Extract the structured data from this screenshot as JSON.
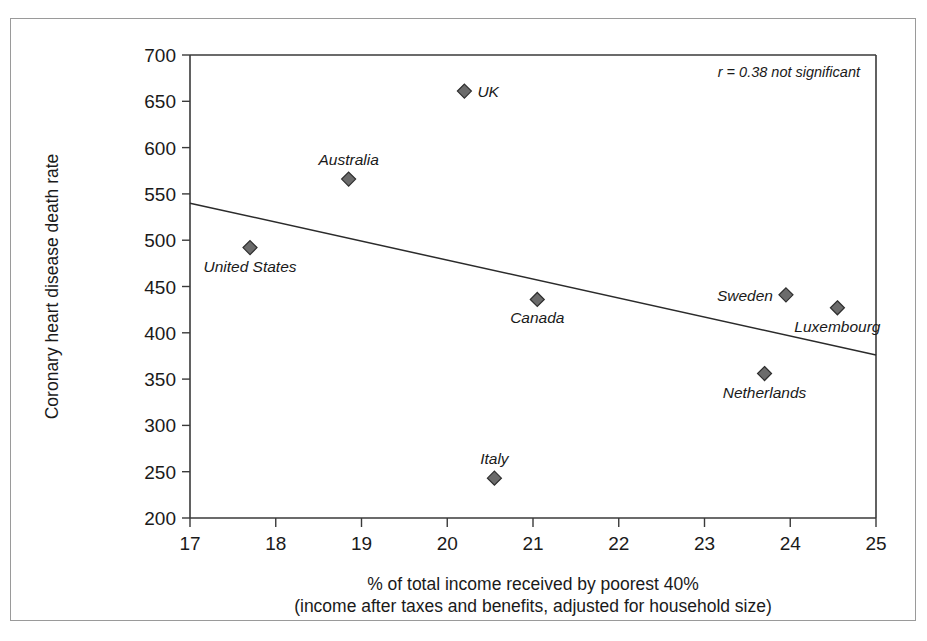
{
  "chart_data": {
    "type": "scatter",
    "title": "",
    "xlabel": "% of total income received by poorest 40%",
    "xlabel_line2": "(income after taxes and benefits, adjusted for household size)",
    "ylabel": "Coronary heart disease death rate",
    "xlim": [
      17,
      25
    ],
    "ylim": [
      200,
      700
    ],
    "xticks": [
      "17",
      "18",
      "19",
      "20",
      "21",
      "22",
      "23",
      "24",
      "25"
    ],
    "xtick_values": [
      17,
      18,
      19,
      20,
      21,
      22,
      23,
      24,
      25
    ],
    "yticks": [
      "700",
      "650",
      "600",
      "550",
      "500",
      "450",
      "400",
      "350",
      "300",
      "250",
      "200"
    ],
    "ytick_values": [
      700,
      650,
      600,
      550,
      500,
      450,
      400,
      350,
      300,
      250,
      200
    ],
    "grid": false,
    "legend": "none",
    "annotation": "r = 0.38 not significant",
    "points": [
      {
        "label": "UK",
        "x": 20.2,
        "y": 661,
        "label_pos": "right"
      },
      {
        "label": "Australia",
        "x": 18.85,
        "y": 566,
        "label_pos": "above"
      },
      {
        "label": "United States",
        "x": 17.7,
        "y": 492,
        "label_pos": "below"
      },
      {
        "label": "Canada",
        "x": 21.05,
        "y": 436,
        "label_pos": "below"
      },
      {
        "label": "Sweden",
        "x": 23.95,
        "y": 441,
        "label_pos": "left"
      },
      {
        "label": "Luxembourg",
        "x": 24.55,
        "y": 427,
        "label_pos": "below"
      },
      {
        "label": "Netherlands",
        "x": 23.7,
        "y": 356,
        "label_pos": "below"
      },
      {
        "label": "Italy",
        "x": 20.55,
        "y": 243,
        "label_pos": "above"
      }
    ],
    "trendline": {
      "x_start": 17,
      "y_start": 540,
      "x_end": 25,
      "y_end": 376,
      "description": "negative linear fit"
    },
    "colors": {
      "marker_fill": "#6b6b6b",
      "marker_stroke": "#2e2e2e",
      "axis": "#3a3a3a",
      "trendline": "#2b2b2b",
      "frame": "#9a9a9a",
      "text": "#1a1a1a",
      "background": "#ffffff"
    }
  }
}
